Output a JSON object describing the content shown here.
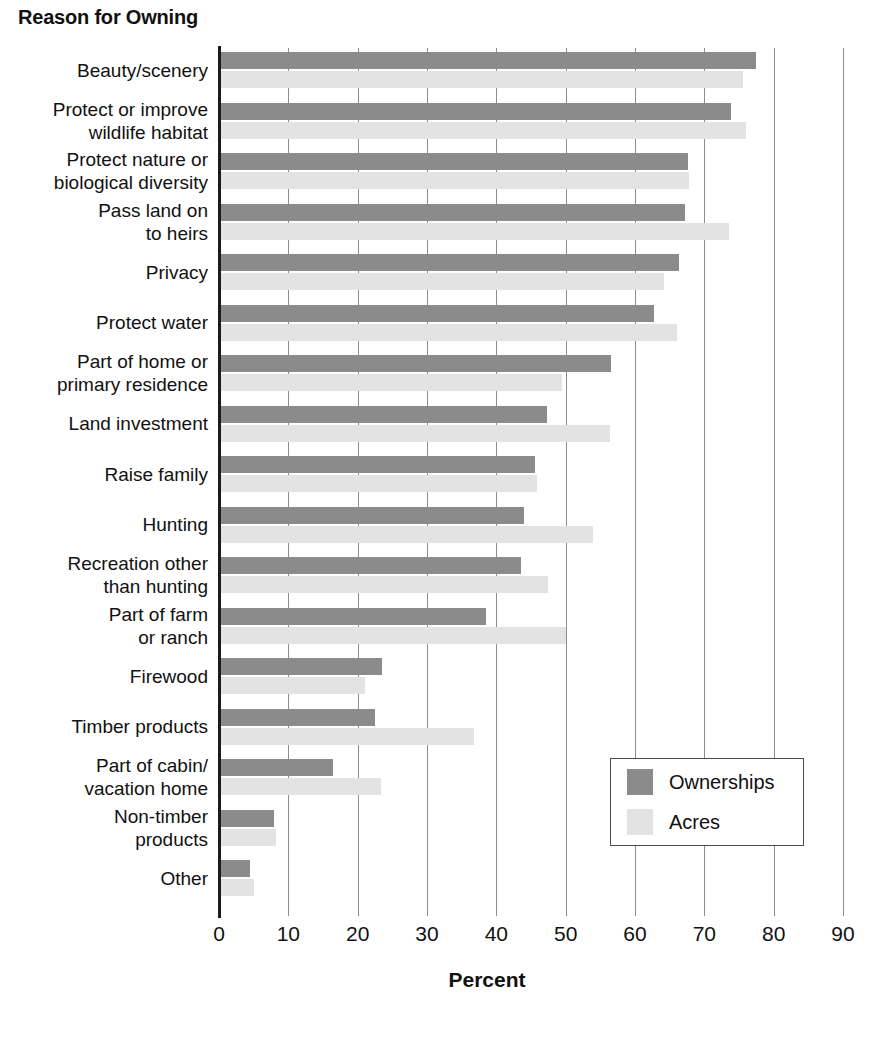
{
  "chart_data": {
    "type": "bar",
    "orientation": "horizontal",
    "title": "Reason for Owning",
    "xlabel": "Percent",
    "ylabel": "",
    "xlim": [
      0,
      90
    ],
    "xticks": [
      0,
      10,
      20,
      30,
      40,
      50,
      60,
      70,
      80,
      90
    ],
    "xtick_labels": [
      "0",
      "10",
      "20",
      "30",
      "40",
      "50",
      "60",
      "70",
      "80",
      "90"
    ],
    "grid": "vertical",
    "legend_position": "lower-right",
    "categories": [
      "Beauty/scenery",
      "Protect or improve\nwildlife habitat",
      "Protect nature or\nbiological diversity",
      "Pass land on\nto heirs",
      "Privacy",
      "Protect water",
      "Part of home or\nprimary residence",
      "Land investment",
      "Raise family",
      "Hunting",
      "Recreation other\nthan hunting",
      "Part of farm\nor ranch",
      "Firewood",
      "Timber products",
      "Part of cabin/\nvacation home",
      "Non-timber\nproducts",
      "Other"
    ],
    "series": [
      {
        "name": "Ownerships",
        "color": "#8b8b8b",
        "values": [
          77.5,
          73.9,
          67.6,
          67.2,
          66.4,
          62.8,
          56.6,
          47.3,
          45.6,
          44.0,
          43.5,
          38.5,
          23.5,
          22.5,
          16.5,
          8.0,
          4.5
        ]
      },
      {
        "name": "Acres",
        "color": "#e3e3e3",
        "values": [
          75.6,
          76.0,
          67.8,
          73.5,
          64.2,
          66.0,
          49.4,
          56.4,
          45.9,
          54.0,
          47.5,
          50.0,
          21.0,
          36.8,
          23.3,
          8.2,
          5.0
        ]
      }
    ]
  },
  "legend": {
    "items": [
      {
        "label": "Ownerships",
        "color": "#8b8b8b"
      },
      {
        "label": "Acres",
        "color": "#e3e3e3"
      }
    ]
  }
}
